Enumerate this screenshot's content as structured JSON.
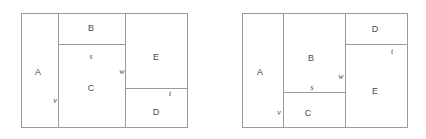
{
  "image": {
    "width": 426,
    "height": 139,
    "background_color": "#ffffff",
    "line_color": "#9a9a9a",
    "text_color": "#4a4a4a",
    "description": "Two rectangle-packing / squared-rectangle diagrams side by side, each subdivided into five labeled regions A, B, C, D, E with edge segment labels s, t, v, w."
  },
  "figures": [
    {
      "id": "left-figure",
      "name": "left-diagram",
      "frame": {
        "x": 21,
        "y": 13,
        "width": 167,
        "height": 115
      },
      "regions": [
        {
          "key": "A",
          "label": "A",
          "label_x": 38,
          "label_y": 72,
          "x": 21,
          "y": 13,
          "width": 37,
          "height": 115
        },
        {
          "key": "B",
          "label": "B",
          "label_x": 91,
          "label_y": 28,
          "x": 58,
          "y": 13,
          "width": 67,
          "height": 31
        },
        {
          "key": "C",
          "label": "C",
          "label_x": 91,
          "label_y": 88,
          "x": 58,
          "y": 44,
          "width": 67,
          "height": 84
        },
        {
          "key": "D",
          "label": "D",
          "label_x": 156,
          "label_y": 112,
          "x": 125,
          "y": 88,
          "width": 63,
          "height": 40
        },
        {
          "key": "E",
          "label": "E",
          "label_x": 156,
          "label_y": 57,
          "x": 125,
          "y": 13,
          "width": 63,
          "height": 75
        }
      ],
      "edge_labels": [
        {
          "key": "s",
          "label": "s",
          "x": 91,
          "y": 57
        },
        {
          "key": "v",
          "label": "v",
          "x": 55,
          "y": 101
        },
        {
          "key": "w",
          "label": "w",
          "x": 122,
          "y": 72
        },
        {
          "key": "t",
          "label": "t",
          "x": 170,
          "y": 94
        }
      ],
      "dividers": {
        "vertical": [
          {
            "x": 58,
            "y": 13,
            "height": 115
          },
          {
            "x": 125,
            "y": 13,
            "height": 115
          }
        ],
        "horizontal": [
          {
            "x": 58,
            "y": 44,
            "width": 67
          },
          {
            "x": 125,
            "y": 88,
            "width": 63
          }
        ]
      }
    },
    {
      "id": "right-figure",
      "name": "right-diagram",
      "frame": {
        "x": 242,
        "y": 13,
        "width": 166,
        "height": 115
      },
      "regions": [
        {
          "key": "A",
          "label": "A",
          "label_x": 260,
          "label_y": 72,
          "x": 242,
          "y": 13,
          "width": 41,
          "height": 115
        },
        {
          "key": "B",
          "label": "B",
          "label_x": 311,
          "label_y": 58,
          "x": 283,
          "y": 13,
          "width": 62,
          "height": 79
        },
        {
          "key": "C",
          "label": "C",
          "label_x": 308,
          "label_y": 113,
          "x": 283,
          "y": 92,
          "width": 62,
          "height": 36
        },
        {
          "key": "D",
          "label": "D",
          "label_x": 375,
          "label_y": 29,
          "x": 345,
          "y": 13,
          "width": 63,
          "height": 31
        },
        {
          "key": "E",
          "label": "E",
          "label_x": 375,
          "label_y": 91,
          "x": 345,
          "y": 44,
          "width": 63,
          "height": 84
        }
      ],
      "edge_labels": [
        {
          "key": "s",
          "label": "s",
          "x": 312,
          "y": 88
        },
        {
          "key": "v",
          "label": "v",
          "x": 279,
          "y": 113
        },
        {
          "key": "w",
          "label": "w",
          "x": 341,
          "y": 77
        },
        {
          "key": "t",
          "label": "t",
          "x": 392,
          "y": 52
        }
      ],
      "dividers": {
        "vertical": [
          {
            "x": 283,
            "y": 13,
            "height": 115
          },
          {
            "x": 345,
            "y": 13,
            "height": 115
          }
        ],
        "horizontal": [
          {
            "x": 283,
            "y": 92,
            "width": 62
          },
          {
            "x": 345,
            "y": 44,
            "width": 63
          }
        ]
      }
    }
  ]
}
